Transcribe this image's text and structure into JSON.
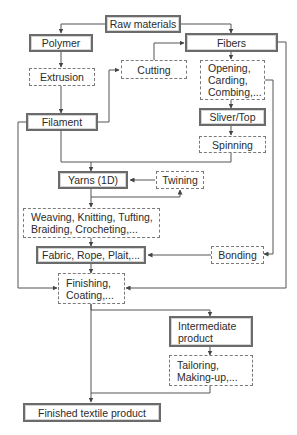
{
  "diagram": {
    "type": "flowchart",
    "legend": {
      "solid_box": "material / product",
      "dashed_box": "process"
    },
    "nodes": {
      "raw_materials": "Raw materials",
      "polymer": "Polymer",
      "fibers": "Fibers",
      "extrusion": "Extrusion",
      "cutting": "Cutting",
      "opening": "Opening,\nCarding,\nCombing,...",
      "filament": "Filament",
      "sliver_top": "Sliver/Top",
      "spinning": "Spinning",
      "yarns": "Yarns (1D)",
      "twining": "Twining",
      "weaving": "Weaving, Knitting, Tufting,\nBraiding, Crocheting,...",
      "fabric": "Fabric, Rope, Plait,...",
      "bonding": "Bonding",
      "finishing": "Finishing,\nCoating,...",
      "intermediate": "Intermediate\nproduct",
      "tailoring": "Tailoring,\nMaking-up,...",
      "finished": "Finished textile product"
    },
    "edges": [
      {
        "from": "Raw materials",
        "to": "Polymer"
      },
      {
        "from": "Raw materials",
        "to": "Fibers"
      },
      {
        "from": "Polymer",
        "to": "Extrusion"
      },
      {
        "from": "Extrusion",
        "to": "Filament"
      },
      {
        "from": "Filament",
        "to": "Cutting"
      },
      {
        "from": "Cutting",
        "to": "Fibers"
      },
      {
        "from": "Fibers",
        "to": "Opening, Carding, Combing,..."
      },
      {
        "from": "Opening, Carding, Combing,...",
        "to": "Sliver/Top"
      },
      {
        "from": "Sliver/Top",
        "to": "Spinning"
      },
      {
        "from": "Spinning",
        "to": "Yarns (1D)"
      },
      {
        "from": "Filament",
        "to": "Yarns (1D)"
      },
      {
        "from": "Yarns (1D)",
        "to": "Twining"
      },
      {
        "from": "Twining",
        "to": "Yarns (1D)"
      },
      {
        "from": "Yarns (1D)",
        "to": "Weaving, Knitting, Tufting, Braiding, Crocheting,..."
      },
      {
        "from": "Weaving, Knitting, Tufting, Braiding, Crocheting,...",
        "to": "Fabric, Rope, Plait,..."
      },
      {
        "from": "Opening, Carding, Combing,...",
        "to": "Bonding"
      },
      {
        "from": "Bonding",
        "to": "Fabric, Rope, Plait,..."
      },
      {
        "from": "Fabric, Rope, Plait,...",
        "to": "Finishing, Coating,..."
      },
      {
        "from": "Filament",
        "to": "Finishing, Coating,..."
      },
      {
        "from": "Fibers",
        "to": "Finishing, Coating,..."
      },
      {
        "from": "Finishing, Coating,...",
        "to": "Intermediate product"
      },
      {
        "from": "Intermediate product",
        "to": "Tailoring, Making-up,..."
      },
      {
        "from": "Tailoring, Making-up,...",
        "to": "Finished textile product"
      },
      {
        "from": "Finishing, Coating,...",
        "to": "Finished textile product"
      }
    ]
  }
}
